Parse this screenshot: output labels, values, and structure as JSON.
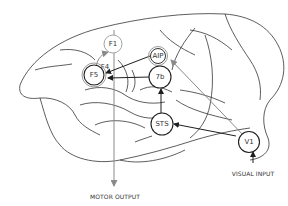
{
  "diagram": {
    "nodes": {
      "f1": "F1",
      "f4": "F4",
      "f5": "F5",
      "aip": "AIP",
      "b7": "7b",
      "sts": "STS",
      "v1": "V1"
    },
    "labels": {
      "motor_output": "MOTOR OUTPUT",
      "visual_input": "VISUAL INPUT"
    },
    "colors": {
      "outline": "#2b2b2b",
      "gray_arrow": "#8a8a8a",
      "node_stroke": "#1e1e1e",
      "light_node_stroke": "#9a9a9a"
    }
  }
}
